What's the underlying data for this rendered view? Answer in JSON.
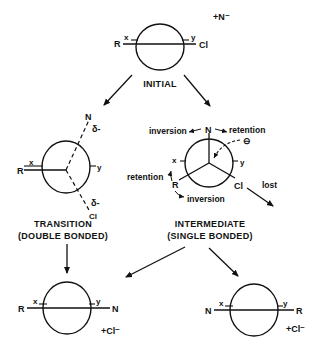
{
  "diagram": {
    "type": "reaction-mechanism",
    "stages": {
      "initial": {
        "caption": "INITIAL",
        "left_atom": "R",
        "left_sub": "x",
        "right_sub": "y",
        "right_atom": "Cl",
        "reagent": "+N⁻"
      },
      "transition": {
        "caption_line1": "TRANSITION",
        "caption_line2": "(DOUBLE BONDED)",
        "left_atom": "R",
        "left_sub": "x",
        "right_sub": "y",
        "top_atom": "N",
        "top_charge": "δ-",
        "bottom_atom": "Cl",
        "bottom_charge": "δ-"
      },
      "intermediate": {
        "caption_line1": "INTERMEDIATE",
        "caption_line2": "(SINGLE BONDED)",
        "top_atom": "N",
        "left_atom": "R",
        "left_sub": "x",
        "right_sub": "y",
        "right_atom": "Cl",
        "charge_symbol": "⊖",
        "label_inversion_top": "inversion",
        "label_retention_top": "retention",
        "label_retention_left": "retention",
        "label_inversion_bottom": "inversion",
        "label_lost": "lost"
      },
      "product_left": {
        "left_atom": "R",
        "left_sub": "x",
        "right_sub": "y",
        "right_atom": "N",
        "byproduct": "+Cl⁻"
      },
      "product_right": {
        "left_atom": "N",
        "left_sub": "x",
        "right_sub": "y",
        "right_atom": "R",
        "byproduct": "+Cl⁻"
      }
    },
    "colors": {
      "ink": "#111111",
      "background": "#ffffff"
    }
  }
}
